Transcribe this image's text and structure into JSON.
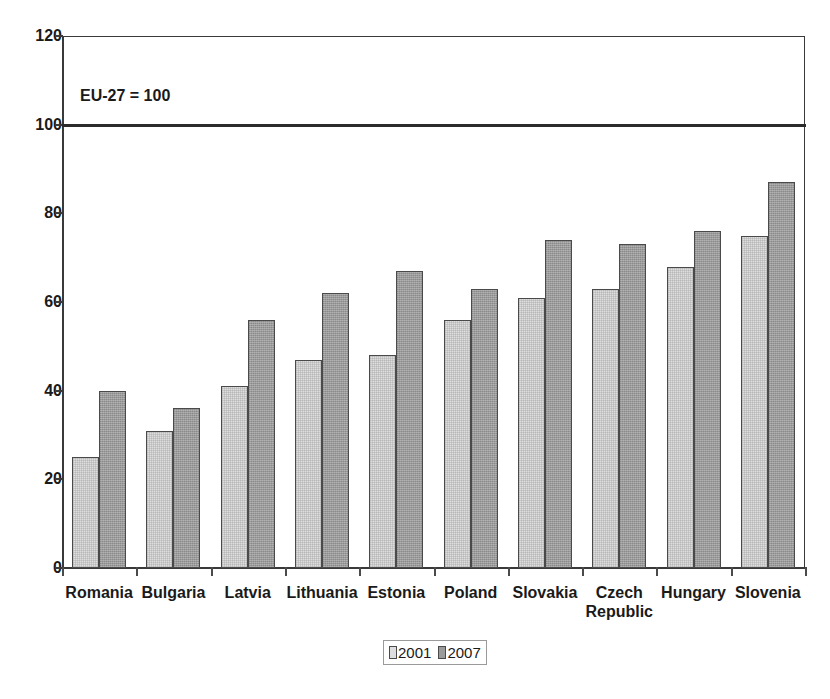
{
  "chart_data": {
    "type": "bar",
    "title": "",
    "subtitle": "",
    "annotation": "EU-27 = 100",
    "xlabel": "",
    "ylabel": "",
    "ylim": [
      0,
      120
    ],
    "yticks": [
      0,
      20,
      40,
      60,
      80,
      100,
      120
    ],
    "ytick_labels": [
      "0",
      "20",
      "40",
      "60",
      "80",
      "100",
      "120"
    ],
    "grid": false,
    "legend_position": "bottom",
    "reference_line": 100,
    "categories": [
      "Romania",
      "Bulgaria",
      "Latvia",
      "Lithuania",
      "Estonia",
      "Poland",
      "Slovakia",
      "Czech\nRepublic",
      "Hungary",
      "Slovenia"
    ],
    "series": [
      {
        "name": "2001",
        "color": "#dedede",
        "values": [
          25,
          31,
          41,
          47,
          48,
          56,
          61,
          63,
          68,
          75
        ]
      },
      {
        "name": "2007",
        "color": "#9b9b9b",
        "values": [
          40,
          36,
          56,
          62,
          67,
          63,
          74,
          73,
          76,
          87
        ]
      }
    ]
  },
  "legend": {
    "items": [
      {
        "label": "2001",
        "swatch": "light-grey-swatch"
      },
      {
        "label": "2007",
        "swatch": "dark-grey-swatch"
      }
    ]
  }
}
